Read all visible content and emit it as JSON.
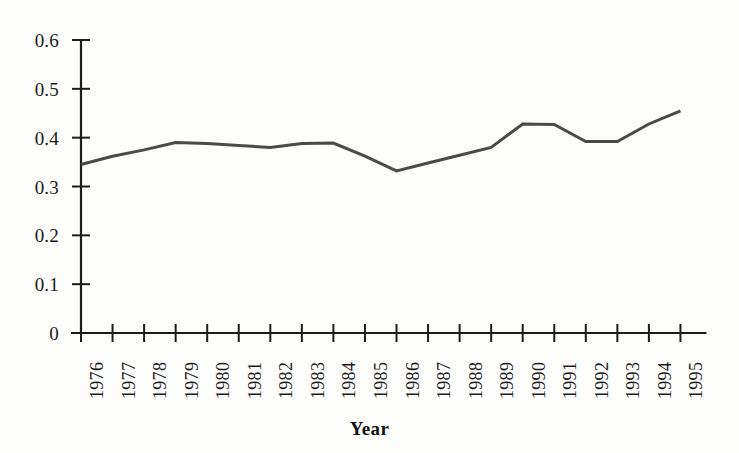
{
  "chart_data": {
    "type": "line",
    "title": "",
    "subtitle": "",
    "xlabel": "Year",
    "ylabel": "",
    "categories": [
      "1976",
      "1977",
      "1978",
      "1979",
      "1980",
      "1981",
      "1982",
      "1983",
      "1984",
      "1985",
      "1986",
      "1987",
      "1988",
      "1989",
      "1990",
      "1991",
      "1992",
      "1993",
      "1994",
      "1995"
    ],
    "x": [
      1976,
      1977,
      1978,
      1979,
      1980,
      1981,
      1982,
      1983,
      1984,
      1985,
      1986,
      1987,
      1988,
      1989,
      1990,
      1991,
      1992,
      1993,
      1994,
      1995
    ],
    "values": [
      0.345,
      0.362,
      0.375,
      0.39,
      0.388,
      0.384,
      0.38,
      0.388,
      0.389,
      0.362,
      0.332,
      0.348,
      0.364,
      0.38,
      0.428,
      0.427,
      0.392,
      0.392,
      0.428,
      0.455
    ],
    "series": [
      {
        "name": "value",
        "values": [
          0.345,
          0.362,
          0.375,
          0.39,
          0.388,
          0.384,
          0.38,
          0.388,
          0.389,
          0.362,
          0.332,
          0.348,
          0.364,
          0.38,
          0.428,
          0.427,
          0.392,
          0.392,
          0.428,
          0.455
        ]
      }
    ],
    "ylim": [
      0,
      0.6
    ],
    "yticks": [
      0,
      0.1,
      0.2,
      0.3,
      0.4,
      0.5,
      0.6
    ],
    "ytick_labels": [
      "0",
      "0.1",
      "0.2",
      "0.3",
      "0.4",
      "0.5",
      "0.6"
    ],
    "xtick_labels": [
      "1976",
      "1977",
      "1978",
      "1979",
      "1980",
      "1981",
      "1982",
      "1983",
      "1984",
      "1985",
      "1986",
      "1987",
      "1988",
      "1989",
      "1990",
      "1991",
      "1992",
      "1993",
      "1994",
      "1995"
    ],
    "xtick_rotation": -90,
    "grid": false,
    "legend": false,
    "legend_position": "none",
    "line_color": "#4a4a4a",
    "axis_color": "#1c1c1c",
    "background_color": "#fdfdfc",
    "line_width": 3,
    "marker": "none"
  },
  "axis_title": {
    "x": "Year"
  }
}
